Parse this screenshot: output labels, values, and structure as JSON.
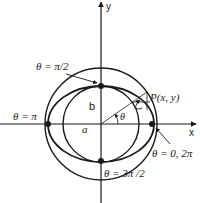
{
  "figure": {
    "kind": "parametric ellipse construction",
    "axes": {
      "x_label": "x",
      "y_label": "y"
    },
    "curves": [
      {
        "name": "outer-circle",
        "radius_label": "a"
      },
      {
        "name": "inner-circle",
        "radius_label": "b"
      },
      {
        "name": "ellipse"
      }
    ],
    "labels": {
      "radius_a": "a",
      "radius_b": "b",
      "angle": "θ",
      "point": "P(x, y)",
      "theta_half_pi": "θ = π/2",
      "theta_pi": "θ = π",
      "theta_zero": "θ = 0, 2π",
      "theta_three_half_pi": "θ = 3π /2"
    },
    "colors": {
      "stroke": "#1a1a1a",
      "background": "#ffffff"
    }
  }
}
